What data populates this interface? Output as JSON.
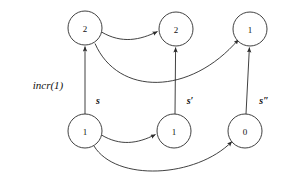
{
  "figure": {
    "name": "incr-transition-diagram",
    "width": 293,
    "height": 175,
    "background": "#ffffff",
    "stroke_color": "#2b2b2b",
    "text_color": "#111111"
  },
  "nodes": [
    {
      "id": "top-left",
      "label": "2",
      "cx": 85,
      "cy": 28,
      "r": 17
    },
    {
      "id": "top-middle",
      "label": "2",
      "cx": 176,
      "cy": 29,
      "r": 17
    },
    {
      "id": "top-right",
      "label": "1",
      "cx": 250,
      "cy": 29,
      "r": 17
    },
    {
      "id": "bottom-left",
      "label": "1",
      "cx": 85,
      "cy": 131,
      "r": 17
    },
    {
      "id": "bottom-middle",
      "label": "1",
      "cx": 174,
      "cy": 131,
      "r": 17
    },
    {
      "id": "bottom-right",
      "label": "0",
      "cx": 245,
      "cy": 131,
      "r": 17
    }
  ],
  "edges": [
    {
      "id": "e-bl-tl",
      "from": "bottom-left",
      "to": "top-left",
      "label": "s",
      "kind": "vertical"
    },
    {
      "id": "e-bm-tm",
      "from": "bottom-middle",
      "to": "top-middle",
      "label": "s′",
      "kind": "vertical"
    },
    {
      "id": "e-br-tr",
      "from": "bottom-right",
      "to": "top-right",
      "label": "s″",
      "kind": "vertical"
    },
    {
      "id": "e-tl-tm",
      "from": "top-left",
      "to": "top-middle",
      "label": "",
      "kind": "curve-top-short"
    },
    {
      "id": "e-tl-tr",
      "from": "top-left",
      "to": "top-right",
      "label": "",
      "kind": "curve-top-long"
    },
    {
      "id": "e-bl-bm",
      "from": "bottom-left",
      "to": "bottom-middle",
      "label": "",
      "kind": "curve-bottom-short"
    },
    {
      "id": "e-bl-br",
      "from": "bottom-left",
      "to": "bottom-right",
      "label": "",
      "kind": "curve-bottom-long"
    }
  ],
  "edge_labels": {
    "s": "s",
    "s_prime": "s′",
    "s_double_prime": "s″"
  },
  "annotations": [
    {
      "id": "incr-label",
      "text": "incr(1)",
      "x": 48,
      "y": 85
    }
  ]
}
